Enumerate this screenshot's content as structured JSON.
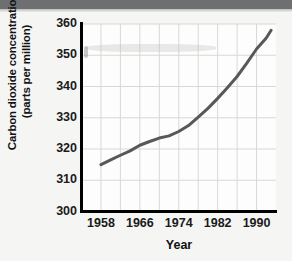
{
  "figure": {
    "background_color": "#f5f5f4",
    "top_band_color": "#6d6f71"
  },
  "axes": {
    "ylabel_line1": "Carbon dioxide concentration",
    "ylabel_line2": "(parts per million)",
    "xlabel": "Year",
    "ytick_labels": [
      "360",
      "350",
      "340",
      "330",
      "320",
      "310",
      "300"
    ],
    "xtick_labels": [
      "1958",
      "1966",
      "1974",
      "1982",
      "1990"
    ],
    "axis_color": "#000000",
    "grid_color": "#d8d8d6"
  },
  "chart_data": {
    "type": "line",
    "title": "",
    "xlabel": "Year",
    "ylabel": "Carbon dioxide concentration (parts per million)",
    "xlim": [
      1954,
      1994
    ],
    "ylim": [
      300,
      360
    ],
    "yticks": [
      300,
      310,
      320,
      330,
      340,
      350,
      360
    ],
    "xticks": [
      1958,
      1966,
      1974,
      1982,
      1990
    ],
    "grid": true,
    "legend": null,
    "line_color": "#58585a",
    "line_width": 3,
    "x": [
      1958,
      1960,
      1962,
      1964,
      1966,
      1968,
      1970,
      1972,
      1974,
      1976,
      1978,
      1980,
      1982,
      1984,
      1986,
      1988,
      1990,
      1992,
      1993
    ],
    "values": [
      315.0,
      316.5,
      318.0,
      319.4,
      321.2,
      322.4,
      323.5,
      324.2,
      325.6,
      327.5,
      330.2,
      333.0,
      336.2,
      339.6,
      343.2,
      347.5,
      352.0,
      355.5,
      358.0
    ],
    "series": [
      {
        "name": "Atmospheric CO2 concentration",
        "values": [
          315.0,
          316.5,
          318.0,
          319.4,
          321.2,
          322.4,
          323.5,
          324.2,
          325.6,
          327.5,
          330.2,
          333.0,
          336.2,
          339.6,
          343.2,
          347.5,
          352.0,
          355.5,
          358.0
        ]
      }
    ]
  }
}
